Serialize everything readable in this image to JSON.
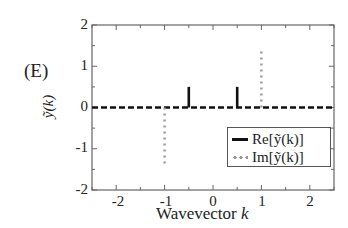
{
  "panel_label": "(E)",
  "chart_data": {
    "type": "line",
    "title": "",
    "xlabel": "Wavevector k",
    "ylabel": "ỹ(k)",
    "xlim": [
      -2.5,
      2.5
    ],
    "ylim": [
      -2,
      2
    ],
    "xticks": [
      -2,
      -1,
      0,
      1,
      2
    ],
    "yticks": [
      -2,
      -1,
      0,
      1,
      2
    ],
    "grid": false,
    "legend_position": "lower right",
    "series": [
      {
        "name": "Re[ỹ(k)]",
        "style": "solid-black-stems",
        "color": "#111111",
        "points": [
          {
            "k": -0.5,
            "value": 0.5
          },
          {
            "k": 0.5,
            "value": 0.5
          }
        ],
        "baseline": 0
      },
      {
        "name": "Im[ỹ(k)]",
        "style": "dotted-gray-stems",
        "color": "#999999",
        "points": [
          {
            "k": -1,
            "value": -1.4
          },
          {
            "k": 1,
            "value": 1.4
          }
        ],
        "baseline": 0
      }
    ],
    "zero_line": {
      "style": "dashed",
      "color": "#111111",
      "y": 0
    }
  },
  "axes": {
    "xlabel_text": "Wavevector ",
    "xlabel_var": "k",
    "ylabel_text": "ỹ(k)",
    "ytick_labels": [
      "2",
      "1",
      "0",
      "-1",
      "-2"
    ],
    "xtick_labels": [
      "-2",
      "-1",
      "0",
      "1",
      "2"
    ]
  },
  "legend": {
    "re_label": "Re[ỹ(k)]",
    "im_label": "Im[ỹ(k)]"
  }
}
